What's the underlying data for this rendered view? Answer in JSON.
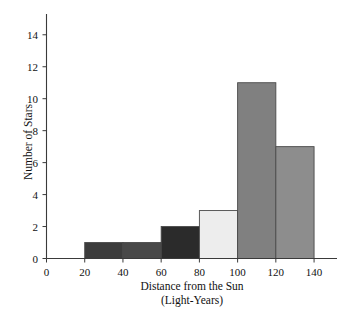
{
  "chart_data": {
    "type": "bar",
    "title": "",
    "subtitle": "",
    "xlabel": "Distance from the Sun",
    "xlabel_line2": "(Light-Years)",
    "ylabel": "Number of Stars",
    "xlim": [
      0,
      152
    ],
    "ylim": [
      0,
      15.3
    ],
    "xticks": [
      0,
      20,
      40,
      60,
      80,
      100,
      120,
      140
    ],
    "yticks": [
      0,
      2,
      4,
      6,
      8,
      10,
      12,
      14
    ],
    "grid": false,
    "legend": null,
    "bin_width": 20,
    "bins": [
      {
        "label": "20-40",
        "x0": 20,
        "x1": 40,
        "value": 1,
        "color": "#3c3c3c"
      },
      {
        "label": "40-60",
        "x0": 40,
        "x1": 60,
        "value": 1,
        "color": "#484848"
      },
      {
        "label": "60-80",
        "x0": 60,
        "x1": 80,
        "value": 2,
        "color": "#2b2b2b"
      },
      {
        "label": "80-100",
        "x0": 80,
        "x1": 100,
        "value": 3,
        "color": "#ededed"
      },
      {
        "label": "100-120",
        "x0": 100,
        "x1": 120,
        "value": 11,
        "color": "#808080"
      },
      {
        "label": "120-140",
        "x0": 120,
        "x1": 140,
        "value": 7,
        "color": "#8d8d8d"
      }
    ],
    "categories": [
      "20-40",
      "40-60",
      "60-80",
      "80-100",
      "100-120",
      "120-140"
    ],
    "values": [
      1,
      1,
      2,
      3,
      11,
      7
    ],
    "total_stars": 25,
    "axis_color": "#3a3a3a",
    "bar_edge_color": "#4a4a4a",
    "background_color": "#ffffff"
  }
}
